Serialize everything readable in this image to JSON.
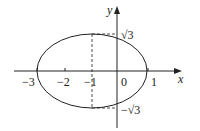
{
  "diagram": {
    "type": "ellipse-on-axes",
    "ellipse": {
      "center": [
        -1,
        0
      ],
      "a": 2,
      "b": "√3"
    },
    "axis_labels": {
      "x": "x",
      "y": "y"
    },
    "x_ticks": [
      {
        "value": -3,
        "label": "−3"
      },
      {
        "value": -2,
        "label": "−2"
      },
      {
        "value": -1,
        "label": "−1"
      },
      {
        "value": 0,
        "label": "0"
      },
      {
        "value": 1,
        "label": "1"
      }
    ],
    "y_labels": {
      "top": "√3",
      "bottom": "−√3"
    },
    "colors": {
      "stroke": "#222222"
    }
  }
}
